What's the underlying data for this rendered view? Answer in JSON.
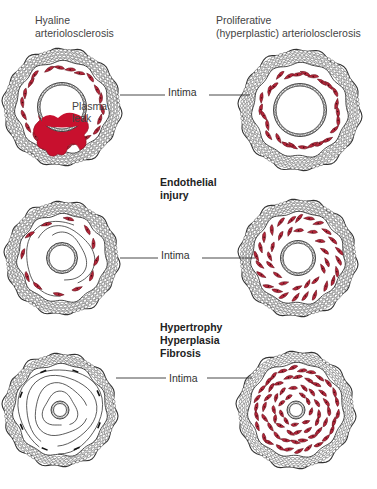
{
  "titles": {
    "left": [
      "Hyaline",
      "arteriolosclerosis"
    ],
    "right": [
      "Proliferative",
      "(hyperplastic) arteriolosclerosis"
    ]
  },
  "stages": {
    "first": [
      "Endothelial",
      "injury"
    ],
    "second": [
      "Hypertrophy",
      "Hyperplasia",
      "Fibrosis"
    ]
  },
  "labels": {
    "intima": "Intima",
    "plasma_leak": [
      "Plasma",
      "leak"
    ]
  },
  "colors": {
    "muscle_cell": "#b5263a",
    "plasma": "#c8102e",
    "outline": "#333333"
  },
  "vessels": [
    {
      "row": 1,
      "column": "hyaline",
      "description": "Endothelial injury with plasma leak into vessel wall"
    },
    {
      "row": 1,
      "column": "proliferative",
      "description": "Early vessel with scattered smooth muscle cells"
    },
    {
      "row": 2,
      "column": "hyaline",
      "description": "Thickened wall with fewer muscle cells and fibrous lines"
    },
    {
      "row": 2,
      "column": "proliferative",
      "description": "Increased smooth muscle cells, narrowed lumen"
    },
    {
      "row": 3,
      "column": "hyaline",
      "description": "Hyaline fibrosis with concentric lines, small lumen"
    },
    {
      "row": 3,
      "column": "proliferative",
      "description": "Onion-skin concentric smooth muscle proliferation, pinpoint lumen"
    }
  ]
}
